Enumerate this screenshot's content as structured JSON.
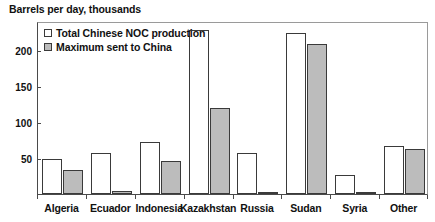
{
  "chart_data": {
    "type": "bar",
    "title": "Barrels per day, thousands",
    "xlabel": "",
    "ylabel": "",
    "ylim": [
      0,
      240
    ],
    "yticks": [
      50,
      100,
      150,
      200
    ],
    "grid": false,
    "legend_position": "top-left",
    "categories": [
      "Algeria",
      "Ecuador",
      "Indonesia",
      "Kazakhstan",
      "Russia",
      "Sudan",
      "Syria",
      "Other"
    ],
    "series": [
      {
        "name": "Total Chinese NOC production",
        "color": "#ffffff",
        "values": [
          48,
          57,
          72,
          228,
          57,
          223,
          27,
          66
        ]
      },
      {
        "name": "Maximum sent to China",
        "color": "#bcbcbc",
        "values": [
          33,
          4,
          46,
          120,
          2,
          208,
          3,
          63
        ]
      }
    ]
  },
  "legend": {
    "items": [
      {
        "label": "Total Chinese NOC production",
        "swatch": "total"
      },
      {
        "label": "Maximum sent to China",
        "swatch": "max"
      }
    ]
  }
}
